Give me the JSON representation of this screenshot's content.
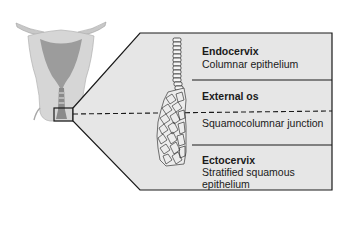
{
  "diagram": {
    "colors": {
      "panel_fill": "#e6e6e6",
      "uterus_outer": "#d4d4d4",
      "uterus_inner": "#9a9a9a",
      "line": "#1a1a1a",
      "background": "#ffffff"
    },
    "sections": [
      {
        "title": "Endocervix",
        "description": "Columnar epithelium"
      },
      {
        "title": "External os",
        "description": "Squamocolumnar junction"
      },
      {
        "title": "Ectocervix",
        "description_line1": "Stratified squamous",
        "description_line2": "epithelium"
      }
    ]
  }
}
